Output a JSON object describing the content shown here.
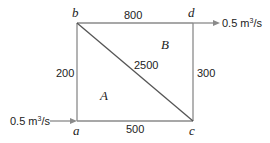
{
  "diagram": {
    "nodes": {
      "a": "a",
      "b": "b",
      "c": "c",
      "d": "d"
    },
    "pipes": {
      "ab": "200",
      "bd": "800",
      "dc": "300",
      "ac": "500",
      "bc": "2500"
    },
    "loops": {
      "A": "A",
      "B": "B"
    },
    "flows": {
      "inflow_value": "0.5 m",
      "inflow_unit_sup": "3",
      "inflow_unit_rest": "/s",
      "outflow_value": "0.5 m",
      "outflow_unit_sup": "3",
      "outflow_unit_rest": "/s"
    },
    "colors": {
      "line": "#8a8a8a",
      "text": "#222222"
    }
  }
}
